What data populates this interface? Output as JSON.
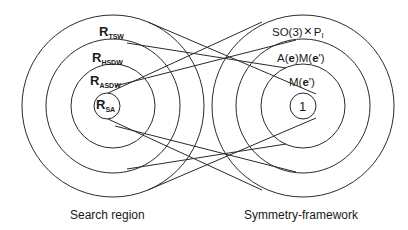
{
  "left_group": {
    "caption": "Search region",
    "rings": [
      {
        "id": "tsw",
        "main": "R",
        "sub": "TSW"
      },
      {
        "id": "hsdw",
        "main": "R",
        "sub": "HSDW"
      },
      {
        "id": "asdw",
        "main": "R",
        "sub": "ASDW"
      },
      {
        "id": "sa",
        "main": "R",
        "sub": "SA"
      }
    ]
  },
  "right_group": {
    "caption": "Symmetry-framework",
    "rings": [
      {
        "id": "so3",
        "label": "SO(3)",
        "cross": "×",
        "tail": "P",
        "tail_sub": "I"
      },
      {
        "id": "aem",
        "label_a": "A(",
        "e1": "e",
        "label_b": ")M(",
        "e2": "e",
        "label_c": "')"
      },
      {
        "id": "me",
        "label_a": "M(",
        "e": "e",
        "label_b": "')"
      },
      {
        "id": "one",
        "label": "1"
      }
    ]
  },
  "correspondences": [
    {
      "from": "tsw",
      "to": "one"
    },
    {
      "from": "hsdw",
      "to": "me"
    },
    {
      "from": "asdw",
      "to": "aem"
    },
    {
      "from": "sa",
      "to": "so3"
    }
  ],
  "colors": {
    "stroke": "#2a2a2a",
    "text": "#1a1a1a",
    "background": "#ffffff"
  }
}
